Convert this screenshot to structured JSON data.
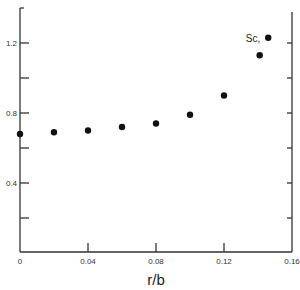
{
  "chart_data": {
    "type": "scatter",
    "title": "",
    "xlabel": "r/b",
    "ylabel": "",
    "xlim": [
      0,
      0.16
    ],
    "ylim": [
      0,
      1.4
    ],
    "grid": false,
    "legend": null,
    "x_ticks": [
      0,
      0.04,
      0.08,
      0.12,
      0.16
    ],
    "x_tick_labels": [
      "0",
      "0.04",
      "0.08",
      "0.12",
      "0.16"
    ],
    "y_ticks": [
      0.2,
      0.4,
      0.6,
      0.8,
      1.0,
      1.2
    ],
    "y_tick_labels": [
      "",
      "0.4",
      "",
      "0.8",
      "",
      "1.2"
    ],
    "series": [
      {
        "name": "data",
        "marker": "filled-circle",
        "color": "#111111",
        "x": [
          0,
          0.02,
          0.04,
          0.06,
          0.08,
          0.1,
          0.12,
          0.141,
          0.146
        ],
        "y": [
          0.68,
          0.69,
          0.7,
          0.72,
          0.74,
          0.79,
          0.9,
          1.13,
          1.23
        ]
      }
    ],
    "annotations": [
      {
        "text": "Sc,",
        "x": 0.146,
        "y": 1.23,
        "position": "left-of-point"
      }
    ]
  }
}
